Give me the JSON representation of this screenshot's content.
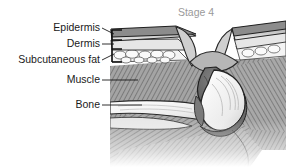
{
  "figure": {
    "title": "Stage 4",
    "title_color": "#9a9a9a",
    "background_color": "#ffffff",
    "labels": [
      {
        "id": "epidermis",
        "text": "Epidermis"
      },
      {
        "id": "dermis",
        "text": "Dermis"
      },
      {
        "id": "subcutaneous-fat",
        "text": "Subcutaneous fat"
      },
      {
        "id": "muscle",
        "text": "Muscle"
      },
      {
        "id": "bone",
        "text": "Bone"
      }
    ],
    "palette": {
      "outline": "#2b2b2b",
      "epidermis_band": "#c9c9c9",
      "dermis_band": "#e4e4e4",
      "fat_fill": "#f2f2f2",
      "muscle_fill": "#9d9d9d",
      "muscle_dark": "#6f6f6f",
      "bone_fill": "#fbfbfb",
      "bone_shadow": "#d8d8d8",
      "wound_cavity": "#6b6b6b",
      "wound_rim": "#b0b0b0",
      "deep_tissue": "#8a8a8a"
    }
  }
}
